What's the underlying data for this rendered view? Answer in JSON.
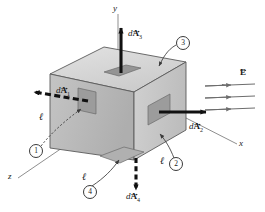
{
  "figure": {
    "background_color": "#ffffff"
  },
  "axes": {
    "y": {
      "label": "y"
    },
    "x": {
      "label": "x"
    },
    "z": {
      "label": "z"
    }
  },
  "field": {
    "label_E": "E",
    "line_count": 3,
    "color": "#6d6d6d",
    "direction": "+x"
  },
  "box": {
    "top_face_color": "#d4d4d4",
    "left_face_color": "#b8b8b8",
    "right_face_color": "#c8c8c8",
    "patch_color": "#9a9a9a",
    "edge_color": "#4a4a4a"
  },
  "area_elements": [
    {
      "id": "dA1",
      "prefix": "d",
      "symbol": "A",
      "subscript": "1",
      "face_number": "1",
      "arrow_style": "dashed",
      "direction": "-z (out of left face)"
    },
    {
      "id": "dA2",
      "prefix": "d",
      "symbol": "A",
      "subscript": "2",
      "face_number": "2",
      "arrow_style": "solid",
      "direction": "+x (out of right face)"
    },
    {
      "id": "dA3",
      "prefix": "d",
      "symbol": "A",
      "subscript": "3",
      "face_number": "3",
      "arrow_style": "solid",
      "direction": "+y (out of top face)"
    },
    {
      "id": "dA4",
      "prefix": "d",
      "symbol": "A",
      "subscript": "4",
      "face_number": "4",
      "arrow_style": "dashed",
      "direction": "-y (out of bottom face)"
    }
  ],
  "edge_labels": [
    {
      "id": "ell-left",
      "text": "ℓ"
    },
    {
      "id": "ell-bottom-left",
      "text": "ℓ"
    },
    {
      "id": "ell-bottom-right",
      "text": "ℓ"
    }
  ],
  "callouts": [
    {
      "number": "1",
      "points_to": "left-face-patch"
    },
    {
      "number": "2",
      "points_to": "right-face"
    },
    {
      "number": "3",
      "points_to": "top-face"
    },
    {
      "number": "4",
      "points_to": "bottom-face-patch"
    }
  ]
}
